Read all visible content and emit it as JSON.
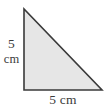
{
  "figure": {
    "name": "right-triangle-diagram",
    "shape": "right triangle",
    "background_color": "#ffffff",
    "fill_color": "#e6e6e6",
    "stroke_color": "#3a3a3a",
    "stroke_width": 1.6,
    "vertices": {
      "apex_top_left": [
        24,
        9
      ],
      "right_angle_bottom_left": [
        24,
        90
      ],
      "bottom_right": [
        102,
        90
      ]
    },
    "polygon_points": "24,9 24,90 102,90"
  },
  "labels": {
    "left_side": {
      "value": "5",
      "unit": "cm",
      "full_text": "5 cm",
      "position": "left of vertical leg"
    },
    "bottom_side": {
      "full_text": "5 cm",
      "value": "5",
      "unit": "cm",
      "position": "below horizontal base"
    }
  },
  "colors": {
    "text": "#3b3b3b",
    "fill": "#e6e6e6",
    "stroke": "#3a3a3a",
    "background": "#ffffff"
  }
}
